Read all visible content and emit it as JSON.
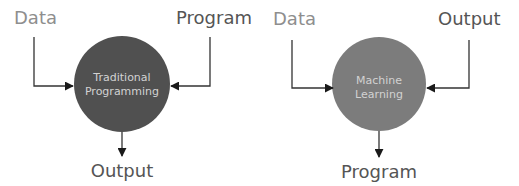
{
  "diagrams": [
    {
      "id": "traditional",
      "center_label": [
        "Traditional",
        "Programming"
      ],
      "input_left": "Data",
      "input_right": "Program",
      "output": "Output",
      "circle_color": "#505050"
    },
    {
      "id": "machine-learning",
      "center_label": [
        "Machine",
        "Learning"
      ],
      "input_left": "Data",
      "input_right": "Output",
      "output": "Program",
      "circle_color": "#7c7c7c"
    }
  ],
  "colors": {
    "data_label": "#8e8e8e",
    "label": "#555555",
    "circle_text": "#d2d2d2",
    "line": "#333333",
    "arrow": "#1a1a1a"
  }
}
